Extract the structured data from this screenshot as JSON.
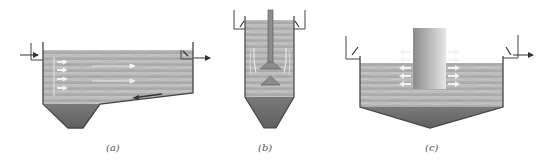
{
  "diagram": {
    "colors": {
      "water": "#b4b4b4",
      "water_light": "#c8c8c8",
      "sludge": "#6e6e6e",
      "wall": "#444444",
      "arrow": "#ffffff",
      "pipe_dark": "#7a7a7a",
      "pipe_light": "#d6d6d6"
    },
    "panels": [
      {
        "id": "a",
        "label": "(a)",
        "type": "horizontal-flow-sedimentation-tank"
      },
      {
        "id": "b",
        "label": "(b)",
        "type": "vertical-flow-sedimentation-tank"
      },
      {
        "id": "c",
        "label": "(c)",
        "type": "radial-flow-sedimentation-tank"
      }
    ]
  }
}
